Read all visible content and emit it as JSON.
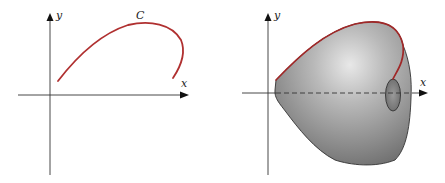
{
  "figure": {
    "left_panel": {
      "axis_x_label": "x",
      "axis_y_label": "y",
      "curve_label": "C",
      "curve_color": "#b03030"
    },
    "right_panel": {
      "axis_x_label": "x",
      "axis_y_label": "y",
      "curve_color": "#a02828",
      "surface_shading": "#8a8a8a"
    }
  }
}
